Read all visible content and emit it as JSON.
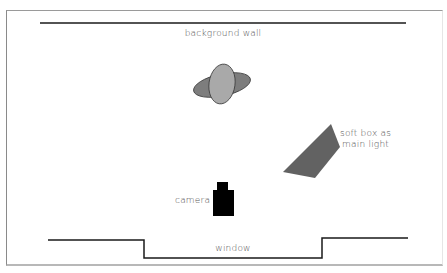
{
  "diagram": {
    "type": "studio lighting floor plan",
    "labels": {
      "wall": "background wall",
      "window": "window",
      "camera": "camera",
      "softbox_line1": "soft box as",
      "softbox_line2": "main light"
    },
    "colors": {
      "line": "#1a1a1a",
      "subject_back": "#7d7d7d",
      "subject_front": "#a9a9a9",
      "softbox": "#626262",
      "camera": "#000000",
      "text": "#555555"
    },
    "elements": [
      {
        "id": "background-wall",
        "kind": "line"
      },
      {
        "id": "subject",
        "kind": "overlapping ellipses"
      },
      {
        "id": "soft-box",
        "kind": "quadrilateral"
      },
      {
        "id": "camera",
        "kind": "body + lens"
      },
      {
        "id": "window",
        "kind": "stepped wall line"
      }
    ]
  }
}
